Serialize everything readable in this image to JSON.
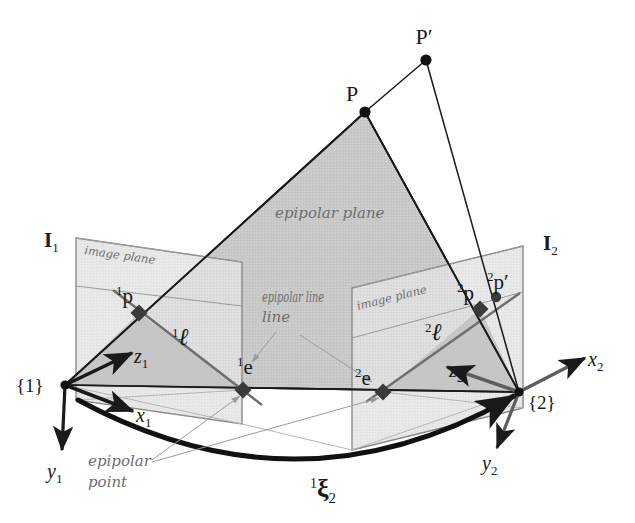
{
  "figure": {
    "type": "diagram"
  },
  "colors": {
    "background": "#ffffff",
    "stroke_dark": "#1a1a1a",
    "stroke_mid": "#707070",
    "stroke_light": "#aaaaaa",
    "epipolar_plane_fill": "#c9c9c9",
    "epipolar_plane_fill_dark": "#bdbdbd",
    "image_plane_fill": "#e2e2e2",
    "image_plane_fill_shaded": "#cfcfcf",
    "handwriting_text": "#6e6e6e",
    "label_text": "#1a1a1a"
  },
  "labels": {
    "scene_point": "P",
    "scene_point_prime": "P′",
    "epipolar_plane": "epipolar plane",
    "epipolar_line": "epipolar line",
    "epipolar_point": "epipolar point",
    "image_plane_left": "image plane",
    "image_plane_right": "image plane",
    "image_frame_left_I": "I",
    "image_frame_left_sub": "1",
    "image_frame_right_I": "I",
    "image_frame_right_sub": "2",
    "frame_one": "{1}",
    "frame_two": "{2}",
    "axis_x1": "x",
    "axis_x1_sub": "1",
    "axis_y1": "y",
    "axis_y1_sub": "1",
    "axis_z1": "z",
    "axis_z1_sub": "1",
    "axis_x2": "x",
    "axis_x2_sub": "2",
    "axis_y2": "y",
    "axis_y2_sub": "2",
    "axis_z2": "z",
    "axis_z2_sub": "2",
    "point_p1_sup": "1",
    "point_p1": "p",
    "point_p2_sup": "2",
    "point_p2": "p",
    "point_p2prime_sup": "2",
    "point_p2prime": "p′",
    "epipole_e1_sup": "1",
    "epipole_e1": "e",
    "epipole_e2_sup": "2",
    "epipole_e2": "e",
    "line_l1_sup": "1",
    "line_l1": "ℓ",
    "line_l2_sup": "2",
    "line_l2": "ℓ",
    "transform_sup": "1",
    "transform_sym": "ξ",
    "transform_sub": "2"
  },
  "geometry": {
    "frame1_origin": [
      65,
      385
    ],
    "frame2_origin": [
      519,
      392
    ],
    "scene_point_P": [
      365,
      112
    ],
    "scene_point_Pprime": [
      426,
      60
    ],
    "epipole_1": [
      243,
      390
    ],
    "epipole_2": [
      383,
      392
    ],
    "image_point_p1": [
      139,
      313
    ],
    "image_point_p2": [
      480,
      309
    ],
    "image_point_p2prime": [
      495,
      298
    ],
    "left_image_plane_corners": [
      [
        76,
        238
      ],
      [
        242,
        262
      ],
      [
        242,
        424
      ],
      [
        76,
        400
      ]
    ],
    "right_image_plane_corners": [
      [
        352,
        288
      ],
      [
        523,
        246
      ],
      [
        523,
        408
      ],
      [
        352,
        450
      ]
    ],
    "epipolar_plane_triangle": [
      [
        65,
        385
      ],
      [
        365,
        112
      ],
      [
        519,
        392
      ]
    ]
  },
  "annotation_leaders": {
    "epipolar_point_to_e1": [
      [
        150,
        463
      ],
      [
        243,
        396
      ]
    ],
    "epipolar_point_to_e2": [
      [
        150,
        463
      ],
      [
        383,
        398
      ]
    ],
    "epipolar_line_label_pos": [
      265,
      300
    ]
  }
}
